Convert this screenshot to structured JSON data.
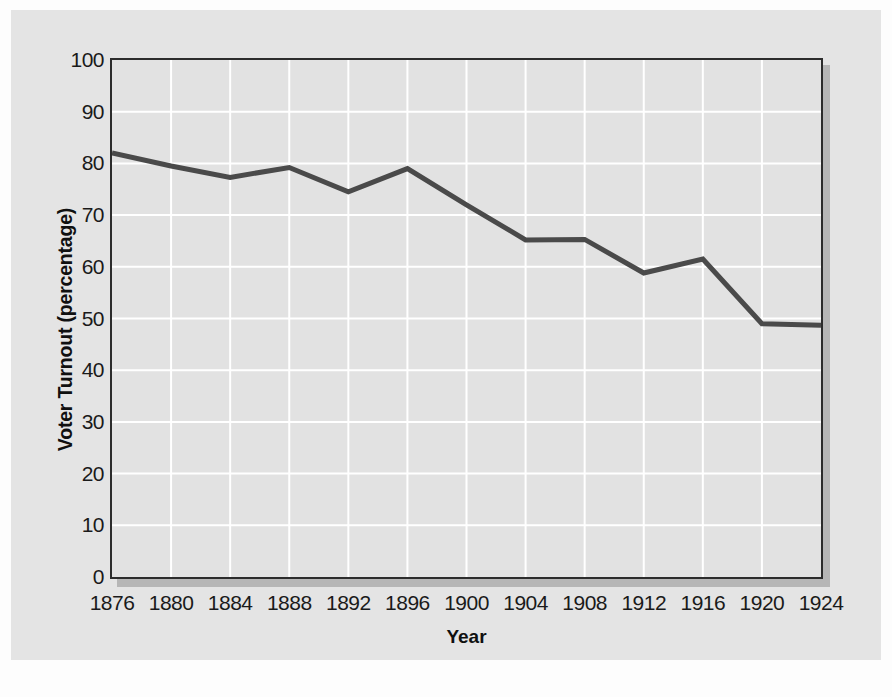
{
  "chart_data": {
    "type": "line",
    "title": "",
    "xlabel": "Year",
    "ylabel": "Voter Turnout (percentage)",
    "x": [
      1876,
      1880,
      1884,
      1888,
      1892,
      1896,
      1900,
      1904,
      1908,
      1912,
      1916,
      1920,
      1924
    ],
    "categories": [
      "1876",
      "1880",
      "1884",
      "1888",
      "1892",
      "1896",
      "1900",
      "1904",
      "1908",
      "1912",
      "1916",
      "1920",
      "1924"
    ],
    "values": [
      82,
      79.5,
      77.3,
      79.2,
      74.5,
      79,
      72,
      65.2,
      65.3,
      58.8,
      61.5,
      49,
      48.7
    ],
    "series": [
      {
        "name": "Voter Turnout",
        "values": [
          82,
          79.5,
          77.3,
          79.2,
          74.5,
          79,
          72,
          65.2,
          65.3,
          58.8,
          61.5,
          49,
          48.7
        ]
      }
    ],
    "ylim": [
      0,
      100
    ],
    "xlim": [
      1876,
      1924
    ],
    "yticks": [
      0,
      10,
      20,
      30,
      40,
      50,
      60,
      70,
      80,
      90,
      100
    ],
    "ytick_labels": [
      "0",
      "10",
      "20",
      "30",
      "40",
      "50",
      "60",
      "70",
      "80",
      "90",
      "100"
    ],
    "xticks": [
      1876,
      1880,
      1884,
      1888,
      1892,
      1896,
      1900,
      1904,
      1908,
      1912,
      1916,
      1920,
      1924
    ],
    "xtick_labels": [
      "1876",
      "1880",
      "1884",
      "1888",
      "1892",
      "1896",
      "1900",
      "1904",
      "1908",
      "1912",
      "1916",
      "1920",
      "1924"
    ],
    "grid": true,
    "grid_color": "#ffffff",
    "legend": null,
    "legend_position": "none",
    "line_color": "#4a4a4a",
    "line_width": 5,
    "plot_background": "#e2e2e2",
    "figure_background": "#e4e4e4",
    "frame_color": "#2c2c2c",
    "annotations": []
  },
  "axis": {
    "y_title": "Voter Turnout (percentage)",
    "x_title": "Year"
  }
}
